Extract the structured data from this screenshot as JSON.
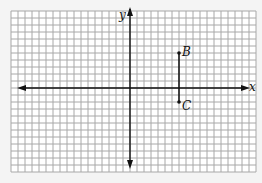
{
  "diagram": {
    "type": "coordinate-plane",
    "grid": {
      "left_px": 11,
      "top_px": 11,
      "cell_px": 7,
      "cols": 35,
      "rows": 23,
      "origin_col": 17,
      "origin_row": 11,
      "line_color": "#a8a8a8",
      "background": "#ffffff"
    },
    "axes": {
      "x_label": "x",
      "y_label": "y",
      "color": "#111111"
    },
    "points": [
      {
        "label": "B",
        "x": 7,
        "y": 5
      },
      {
        "label": "C",
        "x": 7,
        "y": -2
      }
    ],
    "segments": [
      {
        "from": "B",
        "to": "C"
      }
    ]
  }
}
